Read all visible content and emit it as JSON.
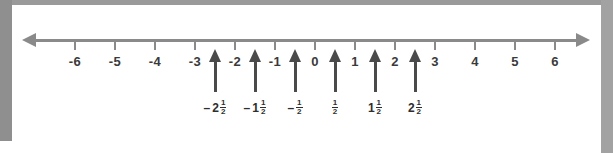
{
  "figure": {
    "line_color": "#8a8a8a",
    "pointer_color": "#4a4a4a",
    "label_color": "#3a3a3a",
    "frame_color": "#8f8f8f",
    "background": "#ffffff"
  },
  "chart_data": {
    "type": "line",
    "xlabel": "",
    "ylabel": "",
    "xlim": [
      -6.8,
      6.8
    ],
    "grid": false,
    "legend": null,
    "axis": {
      "orientation": "horizontal",
      "arrow_left": true,
      "arrow_right": true,
      "tick_values": [
        -6,
        -5,
        -4,
        -3,
        -2,
        -1,
        0,
        1,
        2,
        3,
        4,
        5,
        6
      ],
      "tick_labels": [
        "-6",
        "-5",
        "-4",
        "-3",
        "-2",
        "-1",
        "0",
        "1",
        "2",
        "3",
        "4",
        "5",
        "6"
      ]
    },
    "markers": [
      {
        "value": -2.5,
        "sign": "–",
        "whole": "2",
        "numerator": "1",
        "denominator": "2"
      },
      {
        "value": -1.5,
        "sign": "–",
        "whole": "1",
        "numerator": "1",
        "denominator": "2"
      },
      {
        "value": -0.5,
        "sign": "–",
        "whole": "",
        "numerator": "1",
        "denominator": "2"
      },
      {
        "value": 0.5,
        "sign": "",
        "whole": "",
        "numerator": "1",
        "denominator": "2"
      },
      {
        "value": 1.5,
        "sign": "",
        "whole": "1",
        "numerator": "1",
        "denominator": "2"
      },
      {
        "value": 2.5,
        "sign": "",
        "whole": "2",
        "numerator": "1",
        "denominator": "2"
      }
    ]
  }
}
